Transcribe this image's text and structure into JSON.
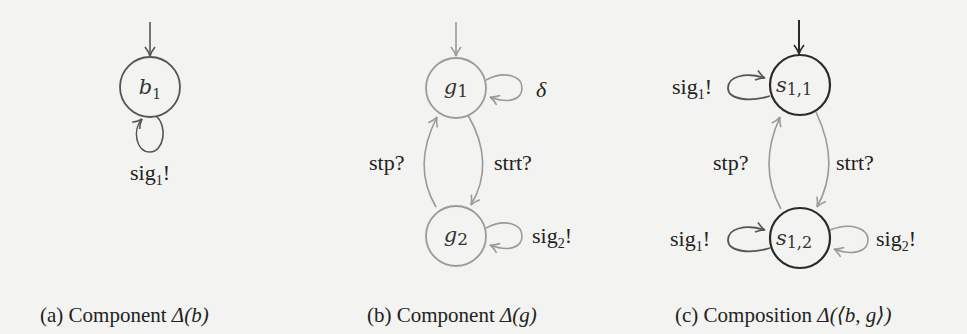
{
  "figure": {
    "colors": {
      "background": "#f3f3f1",
      "dark_stroke": "#2a2a2a",
      "mid_stroke": "#555555",
      "light_stroke": "#9a9a9a",
      "text": "#222222"
    },
    "panels": [
      {
        "id": "a",
        "caption": "(a) Component Δ(b)",
        "caption_prefix": "(a) Component ",
        "caption_math": "Δ(b)",
        "states": [
          {
            "name": "b",
            "sub": "1",
            "initial": true
          }
        ],
        "transitions": [
          {
            "from": "b1",
            "to": "b1",
            "label": "sig",
            "label_sub": "1",
            "label_suffix": "!"
          }
        ]
      },
      {
        "id": "b",
        "caption": "(b) Component Δ(g)",
        "caption_prefix": "(b) Component ",
        "caption_math": "Δ(g)",
        "states": [
          {
            "name": "g",
            "sub": "1",
            "initial": true
          },
          {
            "name": "g",
            "sub": "2",
            "initial": false
          }
        ],
        "transitions": [
          {
            "from": "g1",
            "to": "g1",
            "label": "δ"
          },
          {
            "from": "g1",
            "to": "g2",
            "label": "strt?"
          },
          {
            "from": "g2",
            "to": "g1",
            "label": "stp?"
          },
          {
            "from": "g2",
            "to": "g2",
            "label": "sig",
            "label_sub": "2",
            "label_suffix": "!"
          }
        ]
      },
      {
        "id": "c",
        "caption": "(c) Composition Δ(⟨b, g⟩)",
        "caption_prefix": "(c) Composition ",
        "caption_math": "Δ(⟨b, g⟩)",
        "states": [
          {
            "name": "s",
            "sub": "1,1",
            "initial": true
          },
          {
            "name": "s",
            "sub": "1,2",
            "initial": false
          }
        ],
        "transitions": [
          {
            "from": "s11",
            "to": "s11",
            "label": "sig",
            "label_sub": "1",
            "label_suffix": "!"
          },
          {
            "from": "s11",
            "to": "s12",
            "label": "strt?"
          },
          {
            "from": "s12",
            "to": "s11",
            "label": "stp?"
          },
          {
            "from": "s12",
            "to": "s12",
            "label": "sig",
            "label_sub": "1",
            "label_suffix": "!",
            "side": "left"
          },
          {
            "from": "s12",
            "to": "s12",
            "label": "sig",
            "label_sub": "2",
            "label_suffix": "!",
            "side": "right"
          }
        ]
      }
    ]
  }
}
